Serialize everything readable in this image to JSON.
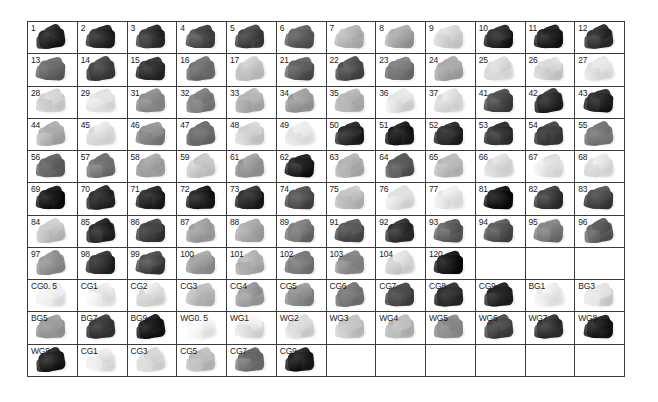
{
  "chart_data": {
    "type": "table",
    "title": "",
    "xlabel": "",
    "ylabel": "",
    "columns": 12,
    "rows": 11,
    "value_unit": "gray level (0=black, 100=white)",
    "grid": true,
    "background": "#ffffff",
    "border_color": "#3a3a3a",
    "label_color": "#1a1a1a",
    "cells": [
      [
        {
          "label": "1",
          "gray": 8
        },
        {
          "label": "2",
          "gray": 13
        },
        {
          "label": "3",
          "gray": 16
        },
        {
          "label": "4",
          "gray": 26
        },
        {
          "label": "5",
          "gray": 22
        },
        {
          "label": "6",
          "gray": 33
        },
        {
          "label": "7",
          "gray": 72
        },
        {
          "label": "8",
          "gray": 62
        },
        {
          "label": "9",
          "gray": 84
        },
        {
          "label": "10",
          "gray": 9
        },
        {
          "label": "11",
          "gray": 7
        },
        {
          "label": "12",
          "gray": 14
        }
      ],
      [
        {
          "label": "13",
          "gray": 38
        },
        {
          "label": "14",
          "gray": 21
        },
        {
          "label": "15",
          "gray": 15
        },
        {
          "label": "16",
          "gray": 41
        },
        {
          "label": "17",
          "gray": 77
        },
        {
          "label": "21",
          "gray": 30
        },
        {
          "label": "22",
          "gray": 24
        },
        {
          "label": "23",
          "gray": 44
        },
        {
          "label": "24",
          "gray": 64
        },
        {
          "label": "25",
          "gray": 88
        },
        {
          "label": "26",
          "gray": 83
        },
        {
          "label": "27",
          "gray": 89
        }
      ],
      [
        {
          "label": "28",
          "gray": 82
        },
        {
          "label": "29",
          "gray": 90
        },
        {
          "label": "31",
          "gray": 52
        },
        {
          "label": "32",
          "gray": 48
        },
        {
          "label": "33",
          "gray": 68
        },
        {
          "label": "34",
          "gray": 58
        },
        {
          "label": "35",
          "gray": 70
        },
        {
          "label": "36",
          "gray": 87
        },
        {
          "label": "37",
          "gray": 86
        },
        {
          "label": "41",
          "gray": 25
        },
        {
          "label": "42",
          "gray": 11
        },
        {
          "label": "43",
          "gray": 10
        }
      ],
      [
        {
          "label": "44",
          "gray": 66
        },
        {
          "label": "45",
          "gray": 86
        },
        {
          "label": "46",
          "gray": 50
        },
        {
          "label": "47",
          "gray": 40
        },
        {
          "label": "48",
          "gray": 80
        },
        {
          "label": "49",
          "gray": 91
        },
        {
          "label": "50",
          "gray": 9
        },
        {
          "label": "51",
          "gray": 6
        },
        {
          "label": "52",
          "gray": 12
        },
        {
          "label": "53",
          "gray": 17
        },
        {
          "label": "54",
          "gray": 19
        },
        {
          "label": "55",
          "gray": 46
        }
      ],
      [
        {
          "label": "56",
          "gray": 37
        },
        {
          "label": "57",
          "gray": 43
        },
        {
          "label": "58",
          "gray": 63
        },
        {
          "label": "59",
          "gray": 81
        },
        {
          "label": "61",
          "gray": 56
        },
        {
          "label": "62",
          "gray": 7
        },
        {
          "label": "63",
          "gray": 67
        },
        {
          "label": "64",
          "gray": 31
        },
        {
          "label": "65",
          "gray": 71
        },
        {
          "label": "66",
          "gray": 85
        },
        {
          "label": "67",
          "gray": 92
        },
        {
          "label": "68",
          "gray": 88
        }
      ],
      [
        {
          "label": "69",
          "gray": 5
        },
        {
          "label": "70",
          "gray": 12
        },
        {
          "label": "71",
          "gray": 11
        },
        {
          "label": "72",
          "gray": 8
        },
        {
          "label": "73",
          "gray": 10
        },
        {
          "label": "74",
          "gray": 27
        },
        {
          "label": "75",
          "gray": 73
        },
        {
          "label": "76",
          "gray": 87
        },
        {
          "label": "77",
          "gray": 91
        },
        {
          "label": "81",
          "gray": 4
        },
        {
          "label": "82",
          "gray": 18
        },
        {
          "label": "83",
          "gray": 23
        }
      ],
      [
        {
          "label": "84",
          "gray": 76
        },
        {
          "label": "85",
          "gray": 10
        },
        {
          "label": "86",
          "gray": 20
        },
        {
          "label": "87",
          "gray": 60
        },
        {
          "label": "88",
          "gray": 65
        },
        {
          "label": "89",
          "gray": 42
        },
        {
          "label": "91",
          "gray": 29
        },
        {
          "label": "92",
          "gray": 13
        },
        {
          "label": "93",
          "gray": 35
        },
        {
          "label": "94",
          "gray": 28
        },
        {
          "label": "95",
          "gray": 45
        },
        {
          "label": "96",
          "gray": 34
        }
      ],
      [
        {
          "label": "97",
          "gray": 55
        },
        {
          "label": "98",
          "gray": 14
        },
        {
          "label": "99",
          "gray": 22
        },
        {
          "label": "100",
          "gray": 57
        },
        {
          "label": "101",
          "gray": 69
        },
        {
          "label": "102",
          "gray": 47
        },
        {
          "label": "103",
          "gray": 51
        },
        {
          "label": "104",
          "gray": 84
        },
        {
          "label": "120",
          "gray": 5
        },
        {
          "label": "",
          "gray": null
        },
        {
          "label": "",
          "gray": null
        },
        {
          "label": "",
          "gray": null
        }
      ],
      [
        {
          "label": "CG0. 5",
          "gray": 95
        },
        {
          "label": "CG1",
          "gray": 92
        },
        {
          "label": "CG2",
          "gray": 85
        },
        {
          "label": "CG3",
          "gray": 74
        },
        {
          "label": "CG4",
          "gray": 61
        },
        {
          "label": "CG5",
          "gray": 53
        },
        {
          "label": "CG6",
          "gray": 44
        },
        {
          "label": "CG7",
          "gray": 24
        },
        {
          "label": "CG8",
          "gray": 12
        },
        {
          "label": "CG9",
          "gray": 8
        },
        {
          "label": "BG1",
          "gray": 92
        },
        {
          "label": "BG3",
          "gray": 86
        }
      ],
      [
        {
          "label": "BG5",
          "gray": 59
        },
        {
          "label": "BG7",
          "gray": 17
        },
        {
          "label": "BG9",
          "gray": 6
        },
        {
          "label": "WG0. 5",
          "gray": 95
        },
        {
          "label": "WG1",
          "gray": 90
        },
        {
          "label": "WG2",
          "gray": 84
        },
        {
          "label": "WG3",
          "gray": 76
        },
        {
          "label": "WG4",
          "gray": 70
        },
        {
          "label": "WG5",
          "gray": 54
        },
        {
          "label": "WG6",
          "gray": 21
        },
        {
          "label": "WG7",
          "gray": 15
        },
        {
          "label": "WG8",
          "gray": 9
        }
      ],
      [
        {
          "label": "WG9",
          "gray": 7
        },
        {
          "label": "CG1",
          "gray": 93
        },
        {
          "label": "CG3",
          "gray": 87
        },
        {
          "label": "CG5",
          "gray": 72
        },
        {
          "label": "CG7",
          "gray": 40
        },
        {
          "label": "CG9",
          "gray": 6
        },
        {
          "label": "",
          "gray": null
        },
        {
          "label": "",
          "gray": null
        },
        {
          "label": "",
          "gray": null
        },
        {
          "label": "",
          "gray": null
        },
        {
          "label": "",
          "gray": null
        },
        {
          "label": "",
          "gray": null
        }
      ]
    ]
  }
}
